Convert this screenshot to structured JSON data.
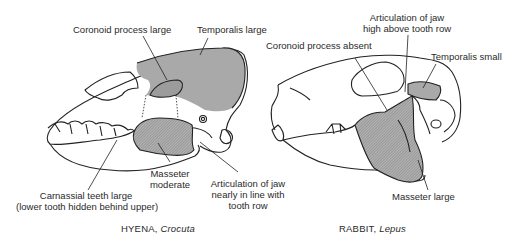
{
  "figure": {
    "hyena": {
      "caption_name": "HYENA,",
      "caption_genus": "Crocuta",
      "labels": {
        "coronoid": "Coronoid process large",
        "temporalis": "Temporalis large",
        "masseter_1": "Masseter",
        "masseter_2": "moderate",
        "carnassial_1": "Carnassial teeth large",
        "carnassial_2": "(lower tooth hidden behind upper)",
        "articulation_1": "Articulation of jaw",
        "articulation_2": "nearly in line with",
        "articulation_3": "tooth row"
      }
    },
    "rabbit": {
      "caption_name": "RABBIT,",
      "caption_genus": "Lepus",
      "labels": {
        "articulation_1": "Articulation of jaw",
        "articulation_2": "high above tooth row",
        "coronoid": "Coronoid process absent",
        "temporalis": "Temporalis small",
        "masseter": "Masseter large"
      }
    },
    "colors": {
      "outline": "#222222",
      "temporalis_fill": "#a9a9a9",
      "masseter_fill": "#9a9a9a"
    }
  }
}
